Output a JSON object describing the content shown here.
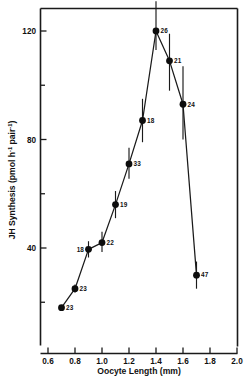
{
  "figure": {
    "background_color": "#ffffff",
    "ink_color": "#111111"
  },
  "chart_data": {
    "type": "line",
    "title": "",
    "subtitle": "",
    "xlabel": "Oocyte Length (mm)",
    "ylabel": "JH Synthesis (pmol h",
    "ylabel_sup1": "-1",
    "ylabel_mid": " pair",
    "ylabel_sup2": "-1",
    "ylabel_end": ")",
    "ylabel_plain": "JH Synthesis (pmol h-1 pair-1)",
    "xlim": [
      0.55,
      2.0
    ],
    "ylim": [
      8,
      132
    ],
    "grid": false,
    "legend": "none",
    "marker_style": "filled-circle",
    "error_bars": "vertical-sem",
    "xticks": [
      0.6,
      0.8,
      1.0,
      1.2,
      1.4,
      1.6,
      1.8,
      2.0
    ],
    "xticklabels": [
      "0.6",
      "0.8",
      "1.0",
      "1.2",
      "1.4",
      "1.6",
      "1.8",
      "2.0"
    ],
    "xminorticks": [
      0.7,
      0.9,
      1.1,
      1.3,
      1.5,
      1.7,
      1.9
    ],
    "yticks": [
      40,
      80,
      120
    ],
    "yticklabels": [
      "40",
      "80",
      "120"
    ],
    "yminorticks": [
      20,
      60,
      100
    ],
    "x": [
      0.7,
      0.8,
      0.9,
      1.0,
      1.1,
      1.2,
      1.3,
      1.4,
      1.5,
      1.6,
      1.7
    ],
    "values": [
      18,
      25,
      39.5,
      42,
      56,
      71,
      87,
      120,
      109,
      93,
      30
    ],
    "err_low": [
      18,
      23.5,
      36.5,
      38.5,
      51,
      65.5,
      79,
      113,
      98,
      80,
      25
    ],
    "err_high": [
      18,
      26.5,
      42.5,
      46,
      61,
      77,
      95,
      131,
      119,
      107,
      35
    ],
    "point_labels": [
      "23",
      "23",
      "18",
      "22",
      "19",
      "33",
      "18",
      "26",
      "21",
      "24",
      "47"
    ],
    "point_label_side": [
      "right",
      "right",
      "left",
      "right",
      "right",
      "right",
      "right",
      "right",
      "right",
      "right",
      "right"
    ]
  }
}
